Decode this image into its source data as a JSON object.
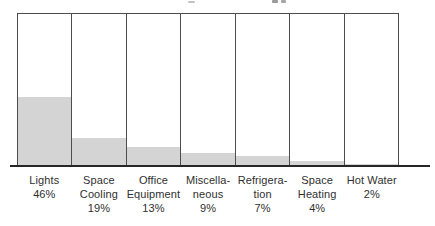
{
  "style": {
    "background": "#ffffff",
    "fill_color": "#d4d4d4",
    "line_color": "#4d4d4d",
    "axis_color": "#262626",
    "text_color": "#2f2f2f"
  },
  "chart_data": {
    "type": "bar",
    "subtype": "percentage-filled-columns",
    "title": "",
    "xlabel": "",
    "ylabel": "",
    "ylim": [
      0,
      100
    ],
    "grid": false,
    "legend": false,
    "orientation": "vertical",
    "note": "Each category drawn as an outlined full-height column; gray fill height equals its percentage of total.",
    "categories": [
      {
        "lines": [
          "Lights"
        ],
        "pct_label": "46%"
      },
      {
        "lines": [
          "Space",
          "Cooling"
        ],
        "pct_label": "19%"
      },
      {
        "lines": [
          "Office",
          "Equipment"
        ],
        "pct_label": "13%"
      },
      {
        "lines": [
          "Miscella-",
          "neous"
        ],
        "pct_label": "9%"
      },
      {
        "lines": [
          "Refrigera-",
          "tion"
        ],
        "pct_label": "7%"
      },
      {
        "lines": [
          "Space",
          "Heating"
        ],
        "pct_label": "4%"
      },
      {
        "lines": [
          "Hot Water"
        ],
        "pct_label": "2%"
      }
    ],
    "values": [
      46,
      19,
      13,
      9,
      7,
      4,
      2
    ]
  }
}
